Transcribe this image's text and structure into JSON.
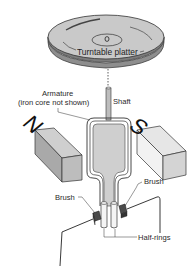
{
  "diagram": {
    "type": "DC motor driving turntable (physics illustration)",
    "labels": {
      "platter": "Turntable platter",
      "armature_line1": "Armature",
      "armature_line2": "(iron core not shown)",
      "shaft": "Shaft",
      "brush_right": "Brush",
      "brush_left": "Brush",
      "half_rings": "Half-rings"
    },
    "magnets": {
      "north": "N",
      "south": "S"
    },
    "colors": {
      "background": "#ffffff",
      "platter_top": "#c9c9c9",
      "platter_edge": "#9a9a9a",
      "magnet_top": "#d6d6d6",
      "magnet_front": "#bdbdbd",
      "magnet_side": "#e9e9e9",
      "armature_fill": "#cfcfcf",
      "brush_fill": "#4a4a4a",
      "line": "#222222"
    }
  }
}
